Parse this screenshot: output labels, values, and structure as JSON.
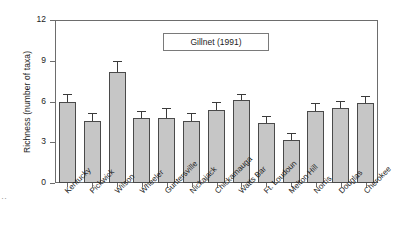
{
  "chart_data": {
    "type": "bar",
    "title": "",
    "legend_label": "Gillnet (1991)",
    "legend_position": "upper-center",
    "xlabel": "",
    "ylabel": "Richness (number of taxa)",
    "ylim": [
      0,
      12
    ],
    "yticks": [
      0,
      3,
      6,
      9,
      12
    ],
    "grid": false,
    "categories": [
      "Kentucky",
      "Pickwick",
      "Wilson",
      "Wheeler",
      "Guntersville",
      "Nickajack",
      "Chickamauga",
      "Watts Bar",
      "Ft. Loudoun",
      "Melton Hill",
      "Norris",
      "Douglas",
      "Cherokee"
    ],
    "values": [
      5.95,
      4.6,
      8.2,
      4.8,
      4.8,
      4.6,
      5.4,
      6.1,
      4.4,
      3.2,
      5.3,
      5.5,
      5.9
    ],
    "errors": [
      0.5,
      0.45,
      0.7,
      0.45,
      0.65,
      0.5,
      0.5,
      0.4,
      0.45,
      0.4,
      0.5,
      0.45,
      0.45
    ],
    "error_type": "upper-whisker",
    "bar_color": "#c6c6c6",
    "bar_edge_color": "#4a4a4a",
    "axis_color": "#6d6d6d"
  },
  "artifact": {
    "mark": "··"
  }
}
